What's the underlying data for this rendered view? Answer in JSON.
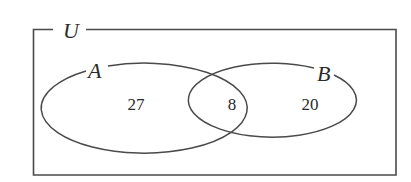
{
  "diagram": {
    "type": "venn",
    "universe": {
      "label": "U"
    },
    "sets": [
      {
        "label": "A",
        "only_count": "27"
      },
      {
        "label": "B",
        "only_count": "20"
      }
    ],
    "intersection": {
      "sets": [
        "A",
        "B"
      ],
      "count": "8"
    },
    "colors": {
      "stroke": "#4a4a4a",
      "text": "#2a2a2a",
      "background": "#ffffff"
    }
  }
}
